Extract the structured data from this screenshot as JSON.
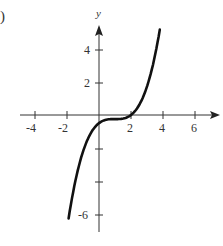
{
  "label_fragment": ")",
  "chart_data": {
    "type": "line",
    "title": "",
    "xlabel": "",
    "ylabel": "y",
    "x_ticks": [
      "-4",
      "-2",
      "2",
      "4",
      "6"
    ],
    "y_ticks": [
      "4",
      "2",
      "-6"
    ],
    "unlabeled_y_ticks": [
      -2,
      -4
    ],
    "xlim": [
      -4.5,
      7
    ],
    "ylim": [
      -7.5,
      5.5
    ],
    "series": [
      {
        "name": "f(x) ≈ 0.25(x-1)^3 - 0.25",
        "x": [
          -1.9,
          -1.5,
          -1,
          -0.5,
          0,
          0.5,
          1,
          1.5,
          2,
          2.5,
          3,
          3.5,
          3.8
        ],
        "values": [
          -6.35,
          -4.16,
          -2.25,
          -1.09,
          -0.5,
          -0.28,
          -0.25,
          -0.22,
          0,
          0.59,
          1.75,
          3.66,
          5.24
        ]
      }
    ],
    "grid": false,
    "legend": "none",
    "line_color": "#111111"
  }
}
